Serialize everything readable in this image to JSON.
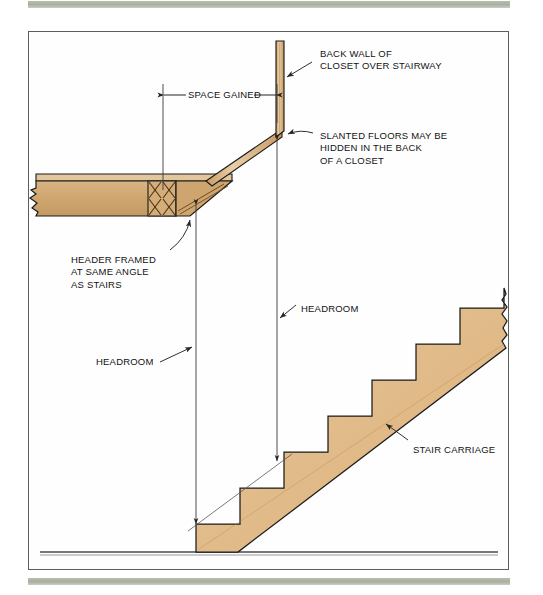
{
  "figure": {
    "kind": "architectural-section-diagram",
    "frame_border_color": "#5a5f58",
    "accent_bands_color": "#a8afa0",
    "colors": {
      "floor_tan": "#d2a974",
      "floor_tan_dark": "#b6884f",
      "stair_tan": "#e3bd8b",
      "wall_tan": "#dcb887",
      "outline": "#1a1a1a",
      "dimension_line": "#3b3b3b",
      "ground_line": "#4a4a4a"
    }
  },
  "labels": {
    "back_wall": "BACK WALL OF\nCLOSET OVER STAIRWAY",
    "slanted_floors": "SLANTED FLOORS MAY BE\nHIDDEN IN THE BACK\nOF A CLOSET",
    "space_gained": "SPACE GAINED",
    "header_framed": "HEADER FRAMED\nAT SAME ANGLE\nAS STAIRS",
    "headroom_upper": "HEADROOM",
    "headroom_lower": "HEADROOM",
    "stair_carriage": "STAIR CARRIAGE"
  },
  "dimensions": {
    "space_gained": {
      "orientation": "horizontal",
      "from_x": 163,
      "to_x": 277,
      "y": 95
    },
    "headroom_lower": {
      "orientation": "vertical",
      "x": 196,
      "from_y": 205,
      "to_y": 524
    },
    "headroom_upper": {
      "orientation": "vertical",
      "x": 277,
      "from_y": 140,
      "to_y": 461
    }
  },
  "geometry": {
    "ground_line_y": 552,
    "stair_steps": 7,
    "stair_base_x": 196,
    "stair_tread_run": 44,
    "stair_riser_rise": 36,
    "break_line_top_right": true,
    "break_line_left_floor": true,
    "bridging_x_braces": 2
  }
}
